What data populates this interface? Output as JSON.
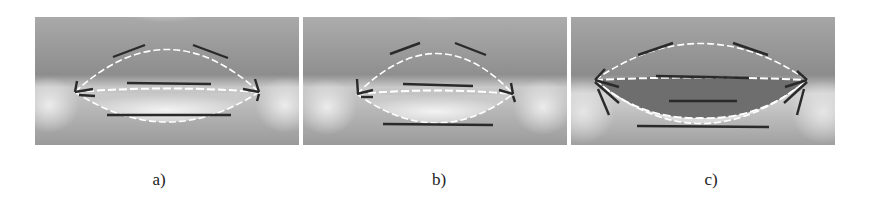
{
  "figure": {
    "panels": [
      {
        "id": "a",
        "label": "a)",
        "description": "Lens-shaped opening with upper arc and lower arc outlined by white dashed curves, black line segments at top, middle and bottom"
      },
      {
        "id": "b",
        "label": "b)",
        "description": "Similar lens-shaped opening, slightly narrower, black line segments at top, middle and bottom"
      },
      {
        "id": "c",
        "label": "c)",
        "description": "Opening with dark filled inner lens region, multiple dashed contours and fan of black segments at both tips"
      }
    ]
  },
  "colors": {
    "field_dark": "#8a8a8a",
    "field_light": "#f4f4f4",
    "segment": "#2a2a2a",
    "dash": "#ffffff",
    "inner_fill": "#6e6e6e"
  }
}
